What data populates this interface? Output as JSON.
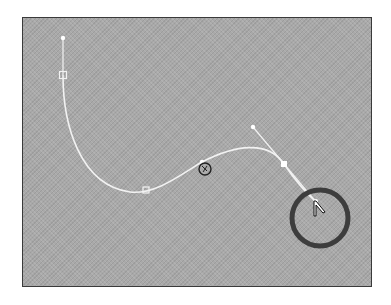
{
  "canvas": {
    "background": "#a9a9a9",
    "border": "#3a3a3a"
  },
  "path": {
    "stroke": "#f2f2f2",
    "anchors": [
      {
        "name": "start-anchor",
        "x": 63,
        "y": 75,
        "type": "hollow-square"
      },
      {
        "name": "middle-anchor-lower",
        "x": 146,
        "y": 190,
        "type": "hollow-square"
      },
      {
        "name": "middle-anchor-center",
        "x": 202,
        "y": 162,
        "type": "filled-dot"
      },
      {
        "name": "selected-anchor",
        "x": 284,
        "y": 164,
        "type": "filled-square"
      },
      {
        "name": "end-anchor",
        "x": 316,
        "y": 202,
        "type": "filled-dot"
      }
    ],
    "handles": [
      {
        "name": "start-handle",
        "from": [
          63,
          75
        ],
        "to": [
          63,
          38
        ]
      },
      {
        "name": "selected-anchor-handle",
        "from": [
          284,
          164
        ],
        "to": [
          253,
          127
        ]
      },
      {
        "name": "end-handle",
        "from": [
          284,
          164
        ],
        "to": [
          316,
          202
        ]
      }
    ]
  },
  "cursors": {
    "rotate_cursor": {
      "x": 205,
      "y": 169
    },
    "pointer_cursor": {
      "x": 317,
      "y": 210
    }
  },
  "highlight": {
    "cx": 320,
    "cy": 218,
    "r": 28,
    "stroke": "#3d3d3d",
    "width": 5
  }
}
